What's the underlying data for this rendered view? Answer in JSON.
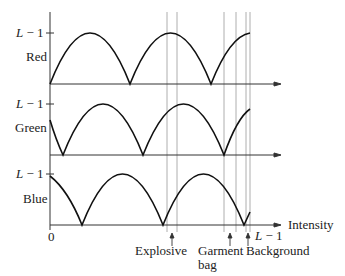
{
  "panels": [
    {
      "name": "Red",
      "top_label": "L − 1"
    },
    {
      "name": "Green",
      "top_label": "L − 1"
    },
    {
      "name": "Blue",
      "top_label": "L − 1"
    }
  ],
  "x_axis": {
    "label": "Intensity",
    "origin": "0",
    "end": "L − 1"
  },
  "markers": [
    {
      "label": "Explosive",
      "label2": ""
    },
    {
      "label": "Garment",
      "label2": "bag"
    },
    {
      "label": "Background",
      "label2": ""
    }
  ]
}
